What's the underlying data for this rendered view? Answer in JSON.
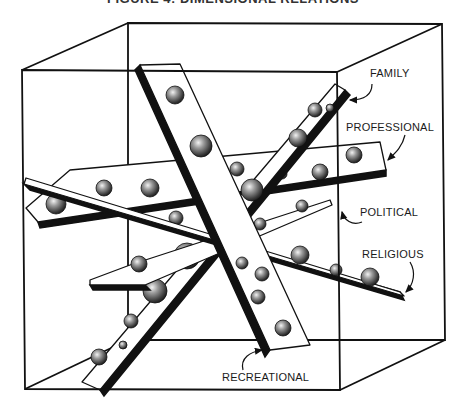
{
  "title": {
    "text": "FIGURE 4: DIMENSIONAL RELATIONS",
    "note": "clipped at top edge; only bottom edges of letters visible"
  },
  "colors": {
    "line": "#111111",
    "plank_fill": "#ffffff",
    "plank_shadow": "#111111",
    "ball_dark": "#1e1e1e",
    "ball_mid": "#7a7a7a",
    "ball_light": "#f2f2f2"
  },
  "cube": {
    "front": [
      [
        22,
        70
      ],
      [
        337,
        72
      ],
      [
        340,
        390
      ],
      [
        25,
        389
      ]
    ],
    "back": [
      [
        128,
        23
      ],
      [
        442,
        24
      ],
      [
        445,
        340
      ],
      [
        128,
        340
      ]
    ]
  },
  "labels": [
    {
      "id": "family",
      "text": "FAMILY",
      "x": 370,
      "y": 77
    },
    {
      "id": "professional",
      "text": "PROFESSIONAL",
      "x": 346,
      "y": 131
    },
    {
      "id": "political",
      "text": "POLITICAL",
      "x": 360,
      "y": 216
    },
    {
      "id": "religious",
      "text": "RELIGIOUS",
      "x": 362,
      "y": 258
    },
    {
      "id": "recreational",
      "text": "RECREATIONAL",
      "x": 222,
      "y": 381
    }
  ],
  "planks": [
    {
      "id": "professional",
      "label": "PROFESSIONAL",
      "top": [
        [
          26,
          208
        ],
        [
          70,
          170
        ],
        [
          380,
          142
        ],
        [
          386,
          170
        ],
        [
          38,
          222
        ]
      ],
      "shadow": [
        [
          38,
          222
        ],
        [
          386,
          170
        ],
        [
          386,
          176
        ],
        [
          40,
          228
        ]
      ],
      "balls": [
        [
          56,
          204,
          10
        ],
        [
          104,
          188,
          8
        ],
        [
          150,
          188,
          9
        ],
        [
          216,
          186,
          7
        ],
        [
          282,
          174,
          5
        ],
        [
          320,
          172,
          8
        ],
        [
          354,
          155,
          8
        ]
      ]
    },
    {
      "id": "family",
      "label": "FAMILY",
      "top": [
        [
          82,
          382
        ],
        [
          335,
          84
        ],
        [
          345,
          90
        ],
        [
          100,
          390
        ]
      ],
      "shadow": [
        [
          100,
          390
        ],
        [
          345,
          90
        ],
        [
          350,
          95
        ],
        [
          104,
          396
        ]
      ],
      "balls": [
        [
          99,
          357,
          8
        ],
        [
          123,
          345,
          4
        ],
        [
          131,
          321,
          7
        ],
        [
          155,
          291,
          12
        ],
        [
          187,
          256,
          13
        ],
        [
          233,
          210,
          6
        ],
        [
          252,
          190,
          11
        ],
        [
          298,
          138,
          9
        ],
        [
          315,
          110,
          7
        ],
        [
          330,
          108,
          4
        ]
      ]
    },
    {
      "id": "political",
      "label": "POLITICAL",
      "top": [
        [
          90,
          280
        ],
        [
          130,
          265
        ],
        [
          330,
          200
        ],
        [
          332,
          205
        ],
        [
          145,
          285
        ],
        [
          90,
          285
        ]
      ],
      "shadow": [
        [
          90,
          285
        ],
        [
          145,
          285
        ],
        [
          150,
          290
        ],
        [
          93,
          290
        ]
      ],
      "balls": [
        [
          139,
          264,
          8
        ],
        [
          176,
          218,
          7
        ],
        [
          260,
          224,
          6
        ],
        [
          302,
          206,
          6
        ]
      ]
    },
    {
      "id": "religious",
      "label": "RELIGIOUS",
      "top": [
        [
          26,
          178
        ],
        [
          400,
          292
        ],
        [
          404,
          296
        ],
        [
          24,
          184
        ]
      ],
      "shadow": [
        [
          24,
          184
        ],
        [
          400,
          292
        ],
        [
          404,
          300
        ],
        [
          30,
          190
        ]
      ],
      "balls": [
        [
          300,
          255,
          9
        ],
        [
          336,
          270,
          6
        ],
        [
          370,
          277,
          9
        ]
      ]
    },
    {
      "id": "recreational",
      "label": "RECREATIONAL",
      "top": [
        [
          140,
          65
        ],
        [
          180,
          64
        ],
        [
          310,
          345
        ],
        [
          270,
          350
        ]
      ],
      "shadow": [
        [
          140,
          65
        ],
        [
          270,
          350
        ],
        [
          265,
          357
        ],
        [
          135,
          70
        ]
      ],
      "balls": [
        [
          175,
          95,
          9
        ],
        [
          201,
          146,
          11
        ],
        [
          237,
          169,
          7
        ],
        [
          242,
          263,
          6
        ],
        [
          262,
          274,
          7
        ],
        [
          258,
          297,
          7
        ],
        [
          283,
          328,
          8
        ]
      ]
    }
  ]
}
